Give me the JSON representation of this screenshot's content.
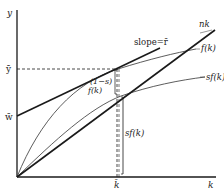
{
  "diagram": {
    "type": "economic-growth-diagram",
    "axes": {
      "y_label": "y",
      "x_label": "k"
    },
    "markers": {
      "y_bar": "ȳ",
      "w_bar": "w̄",
      "k_bar": "k̄"
    },
    "curves": {
      "nk": "nk",
      "f_k": "f(k)",
      "sf_k": "sf(k)",
      "tangent": "slope=r̄"
    },
    "brackets": {
      "one_minus_s": "(1−s)",
      "f_k_inner": "f(k)",
      "sf_k": "sf(k)"
    },
    "colors": {
      "line": "#1a1a1a",
      "thin_line": "#333333",
      "background": "#ffffff"
    }
  }
}
